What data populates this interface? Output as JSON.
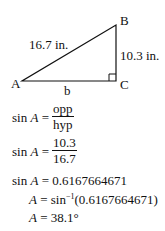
{
  "diagram": {
    "type": "right-triangle",
    "vertices": {
      "A": "A",
      "B": "B",
      "C": "C"
    },
    "sides": {
      "hypotenuse_label": "16.7 in.",
      "opposite_label": "10.3 in.",
      "adjacent_label": "b"
    },
    "right_angle_at": "C"
  },
  "equations": {
    "line1": {
      "lhs_fn": "sin",
      "lhs_var": "A",
      "eq": "=",
      "num": "opp",
      "den": "hyp"
    },
    "line2": {
      "lhs_fn": "sin",
      "lhs_var": "A",
      "eq": "=",
      "num": "10.3",
      "den": "16.7"
    },
    "line3": {
      "lhs_fn": "sin",
      "lhs_var": "A",
      "eq": "=",
      "rhs": "0.6167664671"
    },
    "line4": {
      "lhs_var": "A",
      "eq": "=",
      "fn": "sin",
      "exp": "−1",
      "arg": "(0.6167664671)"
    },
    "line5": {
      "lhs_var": "A",
      "eq": "=",
      "rhs": "38.1°"
    }
  }
}
